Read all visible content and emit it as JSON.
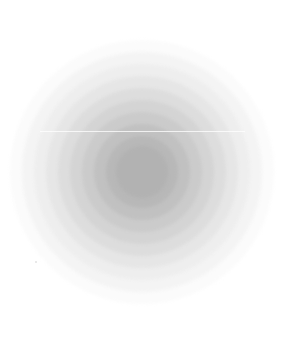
{
  "image": {
    "description": "Concentric gray circles forming a stepped radial gradient, darkest at center",
    "background": "#ffffff",
    "center": [
      142,
      172
    ],
    "rings": [
      {
        "radius": 132,
        "color": "#fbfbfb"
      },
      {
        "radius": 120,
        "color": "#f4f4f4"
      },
      {
        "radius": 108,
        "color": "#eeeeee"
      },
      {
        "radius": 96,
        "color": "#e6e6e6"
      },
      {
        "radius": 84,
        "color": "#dddddd"
      },
      {
        "radius": 72,
        "color": "#d4d4d4"
      },
      {
        "radius": 60,
        "color": "#cbcbcb"
      },
      {
        "radius": 48,
        "color": "#c1c1c1"
      },
      {
        "radius": 36,
        "color": "#b8b8b8"
      },
      {
        "radius": 26,
        "color": "#b2b2b2"
      }
    ]
  }
}
